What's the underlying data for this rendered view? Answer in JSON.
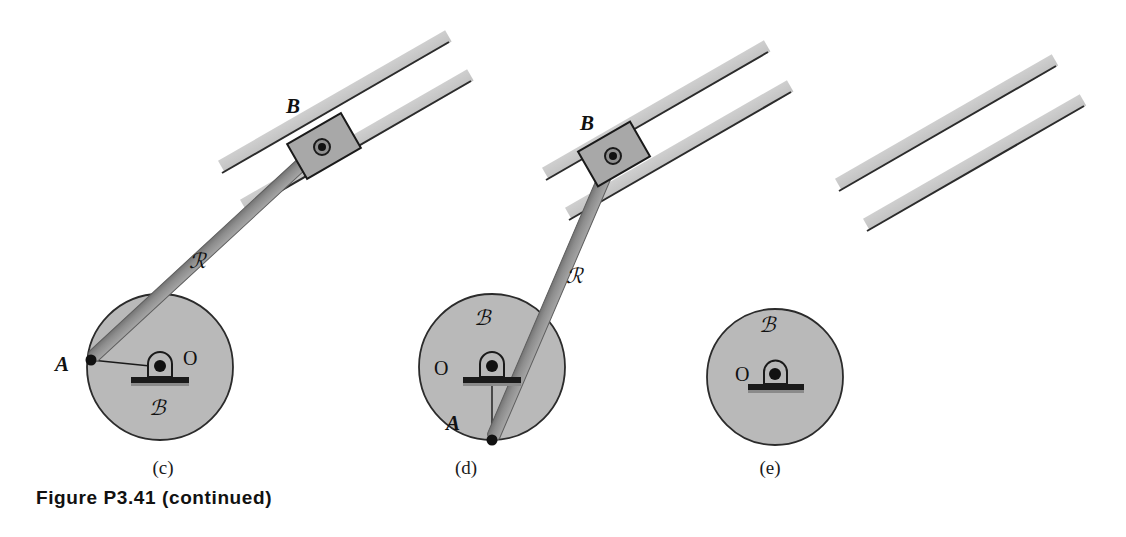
{
  "figure": {
    "caption": "Figure P3.41 (continued)",
    "width": 1126,
    "height": 537,
    "background_color": "#ffffff"
  },
  "colors": {
    "disk_fill": "#b9b9b9",
    "disk_stroke": "#2b2b2b",
    "rod_fill": "#9a9a9a",
    "rod_shade": "#6f6f6f",
    "rail_fill": "#c9c9c9",
    "rail_edge": "#2b2b2b",
    "block_fill": "#a8a8a8",
    "block_stroke": "#1a1a1a",
    "pin_color": "#111111",
    "label_color": "#111111",
    "caption_color": "#111111"
  },
  "panels": [
    {
      "id": "c",
      "label": "(c)",
      "label_x": 163,
      "label_y": 474,
      "disk": {
        "name": "body-B",
        "label": "ℬ",
        "label_x": 157,
        "label_y": 415,
        "cx": 160,
        "cy": 367,
        "r": 73
      },
      "bearing": {
        "label": "O",
        "label_x": 183,
        "label_y": 365,
        "pin_x": 160,
        "pin_y": 367
      },
      "point_a": {
        "label": "A",
        "label_x": 62,
        "label_y": 371,
        "x": 91,
        "y": 360
      },
      "rod": {
        "label": "ℛ",
        "label_x": 197,
        "label_y": 268,
        "x1": 91,
        "y1": 360,
        "x2": 323,
        "y2": 146
      },
      "slider_block": {
        "label": "B",
        "label_x": 293,
        "label_y": 113,
        "cx": 322,
        "cy": 147
      },
      "guide": {
        "angle_deg": -22,
        "upper_rail": {
          "x1": 221,
          "y1": 172,
          "x2": 456,
          "y2": 37
        },
        "lower_rail": {
          "x1": 243,
          "y1": 211,
          "x2": 478,
          "y2": 76
        }
      }
    },
    {
      "id": "d",
      "label": "(d)",
      "label_x": 466,
      "label_y": 474,
      "disk": {
        "name": "body-B",
        "label": "ℬ",
        "label_x": 482,
        "label_y": 325,
        "cx": 492,
        "cy": 367,
        "r": 73
      },
      "bearing": {
        "label": "O",
        "label_x": 440,
        "label_y": 375,
        "pin_x": 492,
        "pin_y": 367
      },
      "point_a": {
        "label": "A",
        "label_x": 453,
        "label_y": 430,
        "x": 492,
        "y": 440
      },
      "rod": {
        "label": "ℛ",
        "label_x": 574,
        "label_y": 283,
        "x1": 492,
        "y1": 440,
        "x2": 614,
        "y2": 155
      },
      "slider_block": {
        "label": "B",
        "label_x": 587,
        "label_y": 130,
        "cx": 613,
        "cy": 156
      },
      "guide": {
        "angle_deg": -22,
        "upper_rail": {
          "x1": 545,
          "y1": 179,
          "x2": 762,
          "y2": 36
        },
        "lower_rail": {
          "x1": 568,
          "y1": 219,
          "x2": 790,
          "y2": 76
        }
      }
    },
    {
      "id": "e",
      "label": "(e)",
      "label_x": 770,
      "label_y": 474,
      "disk": {
        "name": "body-B",
        "label": "ℬ",
        "label_x": 767,
        "label_y": 332,
        "cx": 775,
        "cy": 377,
        "r": 68
      },
      "bearing": {
        "label": "O",
        "label_x": 742,
        "label_y": 380,
        "pin_x": 775,
        "pin_y": 374
      },
      "point_a": null,
      "rod": null,
      "slider_block": null,
      "guide": {
        "angle_deg": -22,
        "upper_rail": {
          "x1": 838,
          "y1": 190,
          "x2": 1050,
          "y2": 50
        },
        "lower_rail": {
          "x1": 866,
          "y1": 230,
          "x2": 1078,
          "y2": 90
        }
      }
    }
  ]
}
